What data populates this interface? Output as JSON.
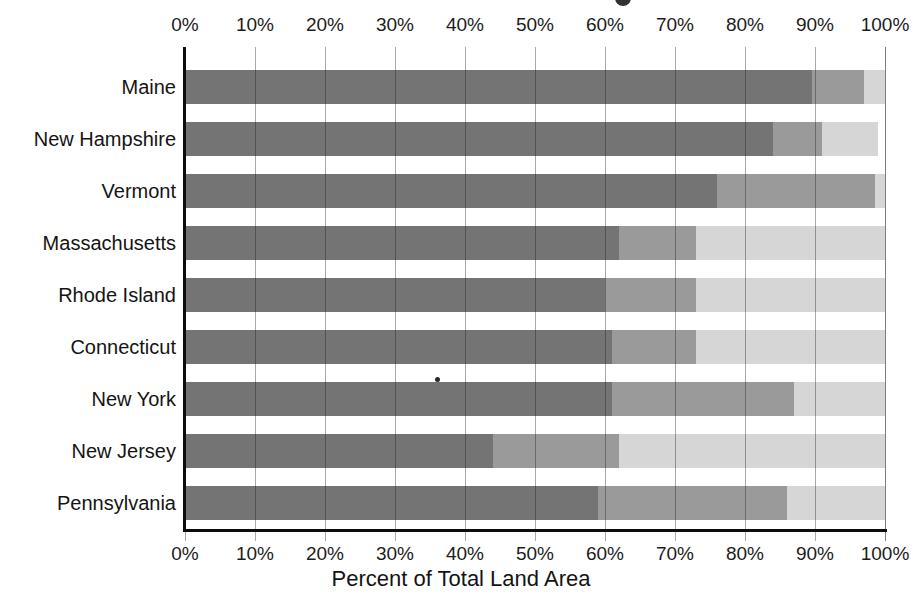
{
  "chart_data": {
    "type": "bar",
    "variant": "horizontal-stacked",
    "title": "",
    "xlabel": "Percent of Total Land Area",
    "ylabel": "",
    "x_range": [
      0,
      100
    ],
    "x_ticks": [
      "0%",
      "10%",
      "20%",
      "30%",
      "40%",
      "50%",
      "60%",
      "70%",
      "80%",
      "90%",
      "100%"
    ],
    "axes_shown": [
      "top",
      "bottom"
    ],
    "grid": "vertical",
    "legend": "none-visible",
    "categories": [
      "Maine",
      "New Hampshire",
      "Vermont",
      "Massachusetts",
      "Rhode Island",
      "Connecticut",
      "New York",
      "New Jersey",
      "Pennsylvania"
    ],
    "series": [
      {
        "name": "dark-gray-segment",
        "color": "#747474",
        "values": [
          89.5,
          84,
          76,
          62,
          60,
          61,
          61,
          44,
          59
        ]
      },
      {
        "name": "medium-gray-segment",
        "color": "#9a9a9a",
        "values": [
          7.5,
          7,
          22.5,
          11,
          13,
          12,
          26,
          18,
          27
        ]
      },
      {
        "name": "light-gray-segment",
        "color": "#d6d6d6",
        "values": [
          3,
          8,
          1.5,
          27,
          27,
          27,
          13,
          38,
          14
        ]
      }
    ]
  },
  "colors": {
    "background": "#ffffff",
    "axis": "#0d0d0d",
    "gridline": "#5a5a5a",
    "text": "#141414"
  },
  "artifacts": {
    "scan_dot_in_new_york_bar": true,
    "cropped_title_remnant_top": true
  }
}
